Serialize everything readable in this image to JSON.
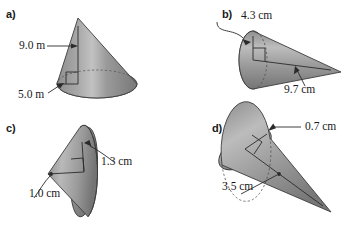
{
  "figure": {
    "shape_type": "cone",
    "label_font_style": "serif",
    "colors": {
      "ink": "#1a1a1a",
      "cone_light": "#c9c9c9",
      "cone_mid": "#8f8f8f",
      "cone_dark": "#6e6e6e",
      "base_light": "#b4b4b4",
      "base_dark": "#7a7a7a",
      "outline": "#3c3c3c",
      "hidden_edge": "#55555",
      "leader": "#2a2a2a"
    }
  },
  "panels": [
    {
      "id": "a",
      "letter": "a)",
      "orientation": "upright, apex at top",
      "units": "m",
      "measurements": [
        {
          "name": "slant-or-height",
          "value": "9.0 m",
          "leader": "arrow pointing right to the cone axis",
          "label_position": "left of cone, upper area"
        },
        {
          "name": "base-radius",
          "value": "5.0 m",
          "leader": "arrow pointing up-right to the base radius",
          "label_position": "lower left of cone"
        }
      ],
      "has_right_angle_marker": true,
      "has_hidden_dashed_ellipse": true
    },
    {
      "id": "b",
      "letter": "b)",
      "orientation": "horizontal, apex pointing right",
      "units": "cm",
      "measurements": [
        {
          "name": "base-radius",
          "value": "4.3 cm",
          "leader": "curved leader hooking down-right to the base radius",
          "label_position": "above the cone, upper left"
        },
        {
          "name": "slant-or-height",
          "value": "9.7 cm",
          "leader": "arrow pointing up-right to the cone axis",
          "label_position": "below the cone, lower right"
        }
      ],
      "has_right_angle_marker": true,
      "has_hidden_dashed_ellipse": true
    },
    {
      "id": "c",
      "letter": "c)",
      "orientation": "horizontal, apex pointing left",
      "units": "cm",
      "measurements": [
        {
          "name": "base-radius",
          "value": "1.3 cm",
          "leader": "curved leader hooking left to the upper base radius",
          "label_position": "right of cone"
        },
        {
          "name": "slant-or-height",
          "value": "1.0 cm",
          "leader": "curved leader hooking up-right to the apex",
          "label_position": "lower left of cone"
        }
      ],
      "has_right_angle_marker": true,
      "has_hidden_dashed_ellipse": false
    },
    {
      "id": "d",
      "letter": "d)",
      "orientation": "tilted, apex pointing to lower right",
      "units": "cm",
      "measurements": [
        {
          "name": "base-radius",
          "value": "0.7 cm",
          "leader": "straight leader from the right to the base radius",
          "label_position": "upper right of cone"
        },
        {
          "name": "slant-or-height",
          "value": "3.5 cm",
          "leader": "arrow pointing up-right to the cone axis",
          "label_position": "lower left of cone"
        }
      ],
      "has_right_angle_marker": true,
      "has_hidden_dashed_ellipse": true
    }
  ]
}
